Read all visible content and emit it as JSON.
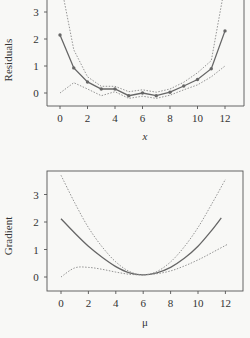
{
  "chart_data": [
    {
      "type": "line",
      "title": "",
      "xlabel": "x",
      "ylabel": "Residuals",
      "xlim": [
        -1,
        13.3
      ],
      "ylim": [
        -0.5,
        3.45
      ],
      "x_ticks": [
        0,
        2,
        4,
        6,
        8,
        10,
        12
      ],
      "y_ticks": [
        0,
        1,
        2,
        3
      ],
      "grid": false,
      "series": [
        {
          "name": "residuals",
          "style": "solid-with-points",
          "x": [
            0,
            1,
            2,
            3,
            4,
            5,
            6,
            7,
            8,
            9,
            10,
            11,
            12
          ],
          "values": [
            2.15,
            0.93,
            0.41,
            0.15,
            0.15,
            -0.1,
            0.0,
            -0.1,
            0.03,
            0.26,
            0.5,
            0.9,
            2.3
          ]
        },
        {
          "name": "upper band",
          "style": "dotted",
          "x": [
            0,
            1,
            2,
            3,
            4,
            5,
            6,
            7,
            8,
            9,
            10,
            11,
            12
          ],
          "values": [
            4.2,
            1.6,
            0.6,
            0.25,
            0.25,
            0.05,
            0.12,
            0.03,
            0.15,
            0.4,
            0.75,
            1.2,
            4.0
          ]
        },
        {
          "name": "lower band",
          "style": "dotted",
          "x": [
            0,
            1,
            2,
            3,
            4,
            5,
            6,
            7,
            8,
            9,
            10,
            11,
            12
          ],
          "values": [
            0.0,
            0.38,
            0.15,
            -0.1,
            0.05,
            -0.2,
            -0.12,
            -0.2,
            -0.08,
            0.12,
            0.3,
            0.6,
            1.0
          ]
        }
      ]
    },
    {
      "type": "line",
      "title": "",
      "xlabel": "μ",
      "ylabel": "Gradient",
      "xlim": [
        -1,
        13.3
      ],
      "ylim": [
        -0.5,
        3.85
      ],
      "x_ticks": [
        0,
        2,
        4,
        6,
        8,
        10,
        12
      ],
      "y_ticks": [
        0,
        1,
        2,
        3
      ],
      "grid": false,
      "series": [
        {
          "name": "gradient",
          "style": "solid",
          "x": [
            0,
            1,
            2,
            3,
            4,
            5,
            6,
            7,
            8,
            9,
            10,
            11,
            11.7
          ],
          "values": [
            2.12,
            1.6,
            1.12,
            0.72,
            0.38,
            0.15,
            0.08,
            0.15,
            0.35,
            0.68,
            1.12,
            1.7,
            2.15
          ]
        },
        {
          "name": "upper band",
          "style": "dotted",
          "x": [
            0,
            1,
            2,
            3,
            4,
            5,
            6,
            7,
            8,
            9,
            10,
            11,
            12
          ],
          "values": [
            3.7,
            2.7,
            1.8,
            1.1,
            0.55,
            0.2,
            0.08,
            0.2,
            0.55,
            1.1,
            1.8,
            2.65,
            3.55
          ]
        },
        {
          "name": "lower band",
          "style": "dotted",
          "x": [
            0,
            1,
            2,
            3,
            4,
            5,
            6,
            7,
            8,
            9,
            10,
            11,
            12.2
          ],
          "values": [
            0.0,
            0.33,
            0.35,
            0.28,
            0.18,
            0.1,
            0.08,
            0.12,
            0.22,
            0.4,
            0.62,
            0.88,
            1.2
          ]
        }
      ]
    }
  ],
  "plots": {
    "top": {
      "xlabel": "x",
      "ylabel": "Residuals",
      "x_tick_labels": [
        "0",
        "2",
        "4",
        "6",
        "8",
        "10",
        "12"
      ],
      "y_tick_labels": [
        "0",
        "1",
        "2",
        "3"
      ]
    },
    "bottom": {
      "xlabel": "μ",
      "ylabel": "Gradient",
      "x_tick_labels": [
        "0",
        "2",
        "4",
        "6",
        "8",
        "10",
        "12"
      ],
      "y_tick_labels": [
        "0",
        "1",
        "2",
        "3"
      ]
    }
  }
}
